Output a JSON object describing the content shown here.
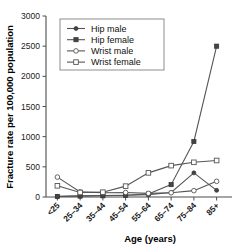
{
  "chart_data": {
    "type": "line",
    "title": "",
    "xlabel": "Age (years)",
    "ylabel": "Fracture rate per 100,000 population",
    "categories": [
      "<25",
      "25–34",
      "35–44",
      "45–54",
      "55–64",
      "65–74",
      "75–84",
      "85+"
    ],
    "ylim": [
      0,
      3000
    ],
    "yticks": [
      0,
      500,
      1000,
      1500,
      2000,
      2500,
      3000
    ],
    "ytick_labels": [
      "0",
      "500",
      "1000",
      "1500",
      "2000",
      "2500",
      "3000"
    ],
    "grid": false,
    "legend_position": "top-center",
    "series": [
      {
        "name": "Hip male",
        "marker": "filled-circle",
        "color": "#444444",
        "values": [
          10,
          20,
          25,
          30,
          40,
          75,
          400,
          110
        ]
      },
      {
        "name": "Hip female",
        "marker": "filled-square",
        "color": "#444444",
        "values": [
          8,
          15,
          20,
          30,
          50,
          205,
          920,
          2500
        ]
      },
      {
        "name": "Wrist male",
        "marker": "open-circle",
        "color": "#555555",
        "values": [
          330,
          85,
          70,
          75,
          60,
          70,
          105,
          260
        ]
      },
      {
        "name": "Wrist female",
        "marker": "open-square",
        "color": "#555555",
        "values": [
          185,
          75,
          80,
          180,
          400,
          520,
          575,
          605
        ]
      }
    ]
  },
  "legend": {
    "items": [
      {
        "label": "Hip male",
        "marker": "filled-circle"
      },
      {
        "label": "Hip female",
        "marker": "filled-square"
      },
      {
        "label": "Wrist male",
        "marker": "open-circle"
      },
      {
        "label": "Wrist female",
        "marker": "open-square"
      }
    ]
  }
}
